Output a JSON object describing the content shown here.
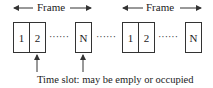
{
  "diagram": {
    "frames": [
      {
        "label": "Frame",
        "slots": [
          {
            "label": "1"
          },
          {
            "label": "2"
          },
          {
            "label": "N"
          }
        ]
      },
      {
        "label": "Frame",
        "slots": [
          {
            "label": "1"
          },
          {
            "label": "2"
          },
          {
            "label": "N"
          }
        ]
      }
    ],
    "ellipsis": "······",
    "caption": "Time slot:  may be emply or occupied",
    "colors": {
      "stroke": "#333333",
      "background": "#ffffff"
    }
  }
}
